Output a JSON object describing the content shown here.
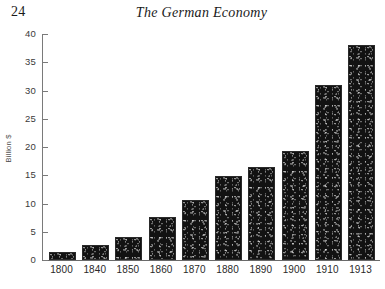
{
  "page": {
    "number": "24",
    "running_title": "The German Economy"
  },
  "chart_data": {
    "type": "bar",
    "title": "",
    "xlabel": "",
    "ylabel": "Billion $",
    "ylim": [
      0,
      40
    ],
    "yticks": [
      0,
      5,
      10,
      15,
      20,
      25,
      30,
      35,
      40
    ],
    "ytick_labels": [
      "0",
      "5",
      "10",
      "15",
      "20",
      "25",
      "30",
      "35",
      "40"
    ],
    "grid": false,
    "legend": "none",
    "bar_color": "#121212",
    "categories": [
      "1800",
      "1840",
      "1850",
      "1860",
      "1870",
      "1880",
      "1890",
      "1900",
      "1910",
      "1913"
    ],
    "values": [
      1.4,
      2.6,
      4.1,
      7.6,
      10.7,
      14.8,
      16.4,
      19.3,
      31.0,
      38.0
    ]
  }
}
